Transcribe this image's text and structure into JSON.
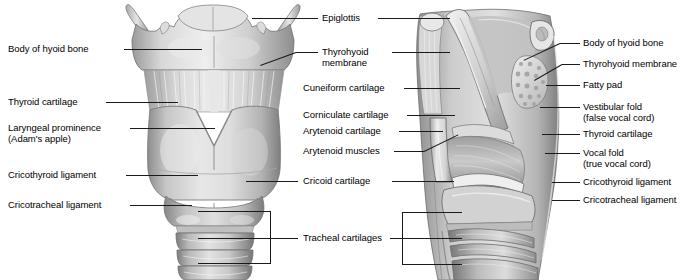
{
  "figure": {
    "background": "#ffffff",
    "ink": "#1a1a1a",
    "width": 689,
    "height": 280
  },
  "panels": {
    "left": {
      "name": "anterior-view-of-larynx"
    },
    "right": {
      "name": "sagittal-section-of-larynx"
    }
  },
  "labels": {
    "left_column": [
      {
        "id": "body-of-hyoid-bone",
        "text": "Body of hyoid bone"
      },
      {
        "id": "thyroid-cartilage",
        "text": "Thyroid cartilage"
      },
      {
        "id": "laryngeal-prominence",
        "text": "Laryngeal prominence",
        "text2": "(Adam's apple)"
      },
      {
        "id": "cricothyroid-ligament",
        "text": "Cricothyroid ligament"
      },
      {
        "id": "cricotracheal-ligament",
        "text": "Cricotracheal ligament"
      }
    ],
    "center_column": [
      {
        "id": "epiglottis",
        "text": "Epiglottis"
      },
      {
        "id": "thyrohyoid-membrane",
        "text": "Thyrohyoid",
        "text2": "membrane"
      },
      {
        "id": "cuneiform-cartilage",
        "text": "Cuneiform cartilage"
      },
      {
        "id": "corniculate-cartilage",
        "text": "Corniculate cartilage"
      },
      {
        "id": "arytenoid-cartilage",
        "text": "Arytenoid cartilage"
      },
      {
        "id": "arytenoid-muscles",
        "text": "Arytenoid muscles"
      },
      {
        "id": "cricoid-cartilage",
        "text": "Cricoid cartilage"
      },
      {
        "id": "tracheal-cartilages",
        "text": "Tracheal cartilages"
      }
    ],
    "right_column": [
      {
        "id": "body-of-hyoid-bone-r",
        "text": "Body of hyoid bone"
      },
      {
        "id": "thyrohyoid-membrane-r",
        "text": "Thyrohyoid membrane"
      },
      {
        "id": "fatty-pad",
        "text": "Fatty pad"
      },
      {
        "id": "vestibular-fold",
        "text": "Vestibular fold",
        "text2": "(false vocal cord)"
      },
      {
        "id": "thyroid-cartilage-r",
        "text": "Thyroid cartilage"
      },
      {
        "id": "vocal-fold",
        "text": "Vocal fold",
        "text2": "(true vocal cord)"
      },
      {
        "id": "cricothyroid-ligament-r",
        "text": "Cricothyroid ligament"
      },
      {
        "id": "cricotracheal-ligament-r",
        "text": "Cricotracheal ligament"
      }
    ]
  }
}
